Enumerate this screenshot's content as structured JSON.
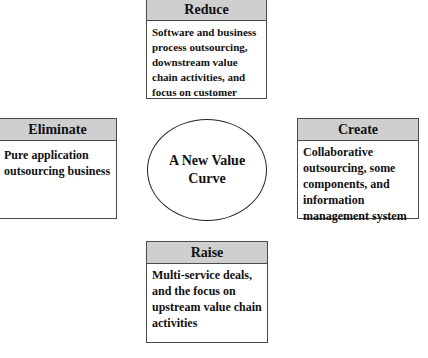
{
  "diagram": {
    "center": {
      "line1": "A New Value",
      "line2": "Curve"
    },
    "reduce": {
      "title": "Reduce",
      "text": "Software and business process outsourcing, downstream value chain activities, and focus on customer"
    },
    "eliminate": {
      "title": "Eliminate",
      "text": "Pure application outsourcing business"
    },
    "create": {
      "title": "Create",
      "text": "Collaborative outsourcing, some components, and information management system"
    },
    "raise": {
      "title": "Raise",
      "text": "Multi-service deals, and the focus on upstream value chain activities"
    },
    "colors": {
      "header_fill": "#cfcfcf",
      "border": "#4a4a4a",
      "background": "#ffffff"
    }
  }
}
